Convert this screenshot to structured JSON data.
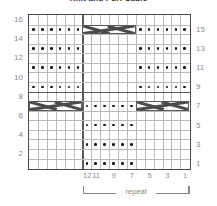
{
  "title": "Knit and Purl Cable",
  "chart_data": {
    "type": "heatmap",
    "title": "Knit and Purl Cable",
    "xlabel": "",
    "ylabel": "",
    "grid": true,
    "columns": 18,
    "rows": 16,
    "column_order": "right-to-left",
    "row_order": "bottom-to-top",
    "row_labels_left": [
      "16",
      "14",
      "12",
      "10",
      "8",
      "6",
      "4",
      "2"
    ],
    "row_labels_right": [
      "15",
      "13",
      "11",
      "9",
      "7",
      "5",
      "3",
      "1"
    ],
    "column_labels": [
      "12",
      "11",
      "9",
      "7",
      "5",
      "3",
      "1"
    ],
    "column_label_positions": [
      12,
      11,
      9,
      7,
      5,
      3,
      1
    ],
    "repeat_label": "repeat",
    "repeat_from_column": 12,
    "repeat_to_column": 1,
    "legend": [
      {
        "symbol": "dot",
        "name": "purl-stitch"
      },
      {
        "symbol": "blank",
        "name": "knit-stitch"
      },
      {
        "symbol": "cross",
        "name": "cable-cross-6-stitch"
      }
    ],
    "purl_dots": [
      {
        "row": 15,
        "columns": [
          18,
          17,
          16,
          15,
          14,
          13,
          6,
          5,
          4,
          3,
          2,
          1
        ]
      },
      {
        "row": 13,
        "columns": [
          18,
          17,
          16,
          15,
          14,
          13,
          6,
          5,
          4,
          3,
          2,
          1
        ]
      },
      {
        "row": 11,
        "columns": [
          18,
          17,
          16,
          15,
          14,
          13,
          6,
          5,
          4,
          3,
          2,
          1
        ]
      },
      {
        "row": 9,
        "columns": [
          18,
          17,
          16,
          15,
          14,
          13,
          6,
          5,
          4,
          3,
          2,
          1
        ]
      },
      {
        "row": 7,
        "columns": [
          12,
          11,
          10,
          9,
          8,
          7
        ]
      },
      {
        "row": 5,
        "columns": [
          12,
          11,
          10,
          9,
          8,
          7
        ]
      },
      {
        "row": 3,
        "columns": [
          12,
          11,
          10,
          9,
          8,
          7
        ]
      },
      {
        "row": 1,
        "columns": [
          12,
          11,
          10,
          9,
          8,
          7
        ]
      }
    ],
    "cable_crosses": [
      {
        "row": 15,
        "column_start": 12,
        "column_end": 7,
        "width": 6
      },
      {
        "row": 7,
        "column_start": 18,
        "column_end": 13,
        "width": 6
      },
      {
        "row": 7,
        "column_start": 6,
        "column_end": 1,
        "width": 6
      }
    ]
  }
}
